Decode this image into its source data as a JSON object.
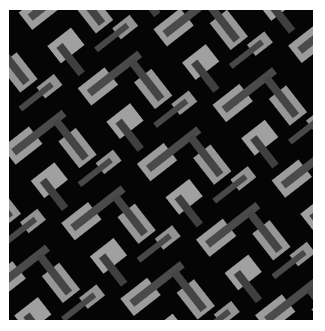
{
  "image": {
    "subject": "geometric textile pattern",
    "description": "Interlocking light-gray rectangles with dark-gray diagonal bars on a black ground, tilted roughly 40 degrees",
    "colors": {
      "background": "#050505",
      "margin": "#ffffff",
      "light_block": "#9a9a9a",
      "dark_bar": "#474747"
    }
  }
}
